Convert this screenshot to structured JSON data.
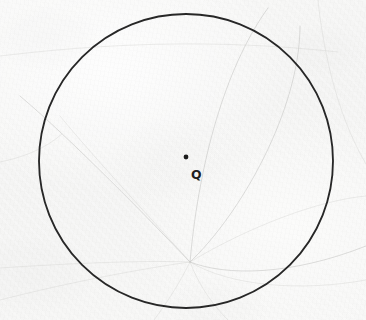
{
  "figure": {
    "kind": "scanned-geometry-figure",
    "medium": "ink on paper scan",
    "paper_color": "#f7f7f6",
    "ink_color": "#272727",
    "bleedthrough_color": "#bfc0bd",
    "width": 366,
    "height": 320
  },
  "circle": {
    "name": "circle-q",
    "center_x": 186,
    "center_y": 161,
    "radius": 147,
    "stroke_color": "#272727",
    "stroke_width": 1.85
  },
  "center_point": {
    "name": "point-q",
    "x": 186,
    "y": 157,
    "radius": 2.4,
    "color": "#1c1c1c"
  },
  "labels": {
    "center": "Q"
  },
  "bleedthrough": {
    "description": "faint gray curves showing through from the reverse side of the page",
    "color": "#bfc0bd",
    "convergence_x": 190,
    "convergence_y": 262
  }
}
